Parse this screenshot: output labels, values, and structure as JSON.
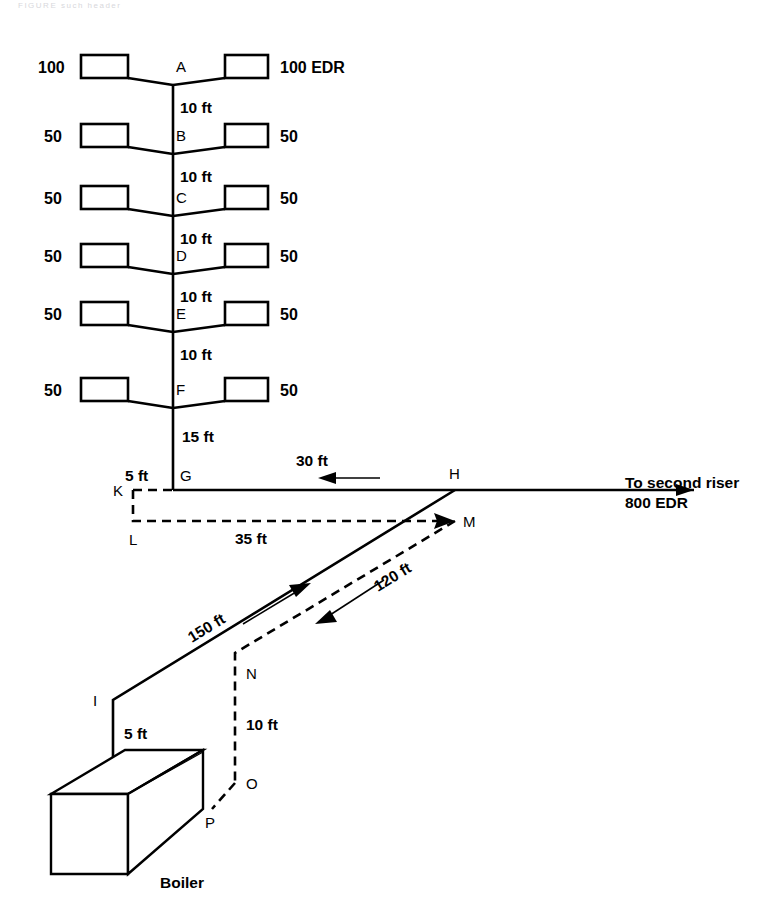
{
  "page": {
    "top_partial_text": "FIGURE  such  header",
    "background": "#ffffff",
    "ink_color": "#000000"
  },
  "diagram": {
    "boiler_caption": "Boiler",
    "destination_line1": "To second riser",
    "destination_line2": "800 EDR",
    "risers": [
      {
        "node": "A",
        "left_rating": "100",
        "right_rating": "100 EDR",
        "drop_label": "10 ft"
      },
      {
        "node": "B",
        "left_rating": "50",
        "right_rating": "50",
        "drop_label": "10 ft"
      },
      {
        "node": "C",
        "left_rating": "50",
        "right_rating": "50",
        "drop_label": "10 ft"
      },
      {
        "node": "D",
        "left_rating": "50",
        "right_rating": "50",
        "drop_label": "10 ft"
      },
      {
        "node": "E",
        "left_rating": "50",
        "right_rating": "50",
        "drop_label": "10 ft"
      },
      {
        "node": "F",
        "left_rating": "50",
        "right_rating": "50",
        "drop_label": "15 ft"
      }
    ],
    "nodes": {
      "A": "A",
      "B": "B",
      "C": "C",
      "D": "D",
      "E": "E",
      "F": "F",
      "G": "G",
      "H": "H",
      "I": "I",
      "J": "J",
      "K": "K",
      "L": "L",
      "M": "M",
      "N": "N",
      "O": "O",
      "P": "P"
    },
    "segments": {
      "g_to_k": "5 ft",
      "h_to_g": "30 ft",
      "l_to_m": "35 ft",
      "i_to_h": "150 ft",
      "m_to_n": "120 ft",
      "i_to_j": "5 ft",
      "n_to_o": "10 ft"
    }
  }
}
